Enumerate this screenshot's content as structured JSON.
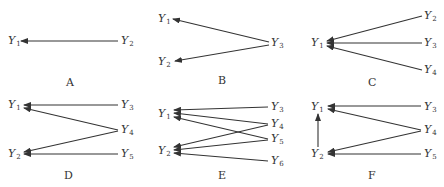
{
  "panels": [
    {
      "label": "A",
      "nodes": [
        {
          "id": "Y1",
          "name": "Y",
          "sub": "1",
          "x": 8,
          "y": 44
        },
        {
          "id": "Y2",
          "name": "Y",
          "sub": "2",
          "x": 121,
          "y": 44
        }
      ],
      "edges": [
        {
          "from": "Y2",
          "to": "Y1",
          "x1": 118,
          "y1": 41,
          "x2": 21,
          "y2": 41
        }
      ],
      "label_pos": {
        "x": 66,
        "y": 86
      }
    },
    {
      "label": "B",
      "nodes": [
        {
          "id": "Y1",
          "name": "Y",
          "sub": "1",
          "x": 158,
          "y": 22
        },
        {
          "id": "Y3",
          "name": "Y",
          "sub": "3",
          "x": 271,
          "y": 46
        },
        {
          "id": "Y2",
          "name": "Y",
          "sub": "2",
          "x": 158,
          "y": 65
        }
      ],
      "edges": [
        {
          "from": "Y3",
          "to": "Y1",
          "x1": 269,
          "y1": 42,
          "x2": 173,
          "y2": 19
        },
        {
          "from": "Y3",
          "to": "Y2",
          "x1": 269,
          "y1": 45,
          "x2": 175,
          "y2": 61
        }
      ],
      "label_pos": {
        "x": 218,
        "y": 84
      }
    },
    {
      "label": "C",
      "nodes": [
        {
          "id": "Y1",
          "name": "Y",
          "sub": "1",
          "x": 311,
          "y": 46
        },
        {
          "id": "Y2",
          "name": "Y",
          "sub": "2",
          "x": 424,
          "y": 19
        },
        {
          "id": "Y3",
          "name": "Y",
          "sub": "3",
          "x": 424,
          "y": 46
        },
        {
          "id": "Y4",
          "name": "Y",
          "sub": "4",
          "x": 424,
          "y": 73
        }
      ],
      "edges": [
        {
          "from": "Y2",
          "to": "Y1",
          "x1": 422,
          "y1": 16,
          "x2": 327,
          "y2": 41
        },
        {
          "from": "Y3",
          "to": "Y1",
          "x1": 422,
          "y1": 43,
          "x2": 327,
          "y2": 43
        },
        {
          "from": "Y4",
          "to": "Y1",
          "x1": 422,
          "y1": 70,
          "x2": 327,
          "y2": 46
        }
      ],
      "label_pos": {
        "x": 368,
        "y": 86
      }
    },
    {
      "label": "D",
      "nodes": [
        {
          "id": "Y1",
          "name": "Y",
          "sub": "1",
          "x": 8,
          "y": 108
        },
        {
          "id": "Y3",
          "name": "Y",
          "sub": "3",
          "x": 121,
          "y": 108
        },
        {
          "id": "Y4",
          "name": "Y",
          "sub": "4",
          "x": 121,
          "y": 133
        },
        {
          "id": "Y2",
          "name": "Y",
          "sub": "2",
          "x": 8,
          "y": 157
        },
        {
          "id": "Y5",
          "name": "Y",
          "sub": "5",
          "x": 121,
          "y": 157
        }
      ],
      "edges": [
        {
          "from": "Y3",
          "to": "Y1",
          "x1": 118,
          "y1": 105,
          "x2": 24,
          "y2": 105
        },
        {
          "from": "Y4",
          "to": "Y1",
          "x1": 118,
          "y1": 130,
          "x2": 24,
          "y2": 108
        },
        {
          "from": "Y4",
          "to": "Y2",
          "x1": 118,
          "y1": 131,
          "x2": 24,
          "y2": 152
        },
        {
          "from": "Y5",
          "to": "Y2",
          "x1": 118,
          "y1": 154,
          "x2": 24,
          "y2": 154
        }
      ],
      "label_pos": {
        "x": 64,
        "y": 179
      }
    },
    {
      "label": "E",
      "nodes": [
        {
          "id": "Y1",
          "name": "Y",
          "sub": "1",
          "x": 158,
          "y": 117
        },
        {
          "id": "Y3",
          "name": "Y",
          "sub": "3",
          "x": 271,
          "y": 110
        },
        {
          "id": "Y4",
          "name": "Y",
          "sub": "4",
          "x": 271,
          "y": 127
        },
        {
          "id": "Y5",
          "name": "Y",
          "sub": "5",
          "x": 271,
          "y": 142
        },
        {
          "id": "Y2",
          "name": "Y",
          "sub": "2",
          "x": 158,
          "y": 154
        },
        {
          "id": "Y6",
          "name": "Y",
          "sub": "6",
          "x": 271,
          "y": 164
        }
      ],
      "edges": [
        {
          "from": "Y3",
          "to": "Y1",
          "x1": 268,
          "y1": 107,
          "x2": 174,
          "y2": 110
        },
        {
          "from": "Y4",
          "to": "Y1",
          "x1": 268,
          "y1": 124,
          "x2": 174,
          "y2": 113
        },
        {
          "from": "Y5",
          "to": "Y1",
          "x1": 268,
          "y1": 139,
          "x2": 174,
          "y2": 117
        },
        {
          "from": "Y4",
          "to": "Y2",
          "x1": 268,
          "y1": 125,
          "x2": 174,
          "y2": 147
        },
        {
          "from": "Y5",
          "to": "Y2",
          "x1": 268,
          "y1": 140,
          "x2": 174,
          "y2": 150
        },
        {
          "from": "Y6",
          "to": "Y2",
          "x1": 268,
          "y1": 161,
          "x2": 174,
          "y2": 153
        }
      ],
      "label_pos": {
        "x": 218,
        "y": 179
      }
    },
    {
      "label": "F",
      "nodes": [
        {
          "id": "Y1",
          "name": "Y",
          "sub": "1",
          "x": 311,
          "y": 110
        },
        {
          "id": "Y3",
          "name": "Y",
          "sub": "3",
          "x": 424,
          "y": 110
        },
        {
          "id": "Y4",
          "name": "Y",
          "sub": "4",
          "x": 424,
          "y": 133
        },
        {
          "id": "Y2",
          "name": "Y",
          "sub": "2",
          "x": 311,
          "y": 157
        },
        {
          "id": "Y5",
          "name": "Y",
          "sub": "5",
          "x": 424,
          "y": 157
        }
      ],
      "edges": [
        {
          "from": "Y3",
          "to": "Y1",
          "x1": 421,
          "y1": 106,
          "x2": 328,
          "y2": 106
        },
        {
          "from": "Y4",
          "to": "Y1",
          "x1": 421,
          "y1": 130,
          "x2": 328,
          "y2": 109
        },
        {
          "from": "Y4",
          "to": "Y2",
          "x1": 421,
          "y1": 131,
          "x2": 328,
          "y2": 152
        },
        {
          "from": "Y5",
          "to": "Y2",
          "x1": 421,
          "y1": 154,
          "x2": 328,
          "y2": 154
        },
        {
          "from": "Y2",
          "to": "Y1",
          "x1": 318,
          "y1": 147,
          "x2": 318,
          "y2": 114
        }
      ],
      "label_pos": {
        "x": 368,
        "y": 179
      }
    }
  ]
}
